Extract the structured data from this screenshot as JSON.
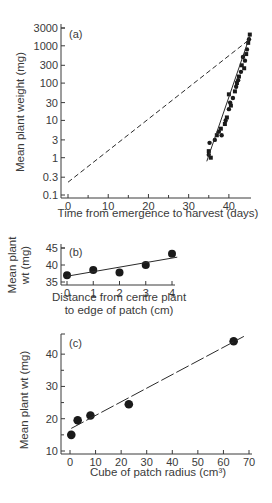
{
  "chart_data": [
    {
      "type": "scatter",
      "panel": "(a)",
      "title": "",
      "xlabel": "Time from emergence to harvest (days)",
      "ylabel": "Mean plant weight (mg)",
      "yscale": "log",
      "xlim": [
        0,
        45
      ],
      "ylim": [
        0.1,
        3000
      ],
      "xticks": [
        0,
        10,
        20,
        30,
        40
      ],
      "yticks": [
        0.1,
        0.3,
        1,
        3,
        10,
        30,
        100,
        300,
        1000,
        3000
      ],
      "ytick_labels": [
        "0.1",
        "0.3",
        "1",
        "3",
        "10",
        "30",
        "100",
        "300",
        "1000",
        "3000"
      ],
      "grid": false,
      "series": [
        {
          "name": "observed",
          "style": "markers",
          "x": [
            35,
            35,
            35.2,
            35.5,
            36.5,
            37,
            37.5,
            38,
            38.2,
            39,
            39.2,
            39.5,
            40,
            40,
            40.3,
            40.5,
            41,
            41.5,
            41.8,
            42,
            42.3,
            42.5,
            43,
            43.2,
            43.5,
            43.8,
            44,
            44.3,
            44.5,
            44.8,
            45,
            45.2
          ],
          "y": [
            1.2,
            1.5,
            2.5,
            1.0,
            3,
            4,
            5,
            6,
            4,
            8,
            10,
            12,
            20,
            50,
            30,
            25,
            40,
            60,
            80,
            100,
            120,
            150,
            200,
            300,
            500,
            250,
            400,
            600,
            800,
            1200,
            1500,
            2000
          ]
        },
        {
          "name": "fitted-steep",
          "style": "solid-line",
          "x": [
            34.5,
            45.2
          ],
          "y": [
            0.8,
            1800
          ]
        },
        {
          "name": "dashed-reference",
          "style": "dashed-line",
          "x": [
            0,
            45.2
          ],
          "y": [
            0.22,
            1500
          ]
        }
      ]
    },
    {
      "type": "scatter",
      "panel": "(b)",
      "xlabel": "Distance from centre plant to edge of patch (cm)",
      "ylabel": "Mean plant wt (mg)",
      "xlim": [
        0,
        4
      ],
      "ylim": [
        35,
        45
      ],
      "xticks": [
        0,
        1,
        2,
        3,
        4
      ],
      "yticks": [
        35,
        40,
        45
      ],
      "grid": false,
      "series": [
        {
          "name": "observed",
          "style": "markers",
          "x": [
            0,
            1,
            2,
            3,
            4
          ],
          "y": [
            37,
            38.5,
            37.8,
            40,
            43.3
          ]
        },
        {
          "name": "fit",
          "style": "solid-line",
          "x": [
            0,
            4.2
          ],
          "y": [
            36.7,
            42.3
          ]
        }
      ]
    },
    {
      "type": "scatter",
      "panel": "(c)",
      "xlabel": "Cube of patch radius (cm³)",
      "ylabel": "Mean plant wt (mg)",
      "xlim": [
        0,
        70
      ],
      "ylim": [
        10,
        45
      ],
      "xticks": [
        0,
        10,
        20,
        30,
        40,
        50,
        60,
        70
      ],
      "yticks": [
        10,
        20,
        30,
        40
      ],
      "grid": false,
      "series": [
        {
          "name": "observed",
          "style": "markers",
          "x": [
            0.5,
            3,
            8,
            23,
            64
          ],
          "y": [
            15,
            19.5,
            21,
            24.5,
            44
          ]
        },
        {
          "name": "fit",
          "style": "dash-line",
          "x": [
            0.5,
            68
          ],
          "y": [
            17,
            45.5
          ]
        }
      ]
    }
  ],
  "labels": {
    "a": {
      "panel": "(a)",
      "xlabel": "Time from emergence to harvest (days)",
      "ylabel": "Mean plant weight (mg)",
      "yticks": [
        "3000",
        "1000",
        "300",
        "100",
        "30",
        "10",
        "3",
        "1",
        "0.3",
        "0.1"
      ],
      "xticks": [
        "0",
        "10",
        "20",
        "30",
        "40"
      ]
    },
    "b": {
      "panel": "(b)",
      "xlabel_line1": "Distance from centre plant",
      "xlabel_line2": "to edge of patch (cm)",
      "ylabel_line1": "Mean plant",
      "ylabel_line2": "wt (mg)",
      "yticks": [
        "45",
        "40",
        "35"
      ],
      "xticks": [
        "0",
        "1",
        "2",
        "3",
        "4"
      ]
    },
    "c": {
      "panel": "(c)",
      "xlabel": "Cube of patch radius (cm³)",
      "ylabel": "Mean plant wt (mg)",
      "yticks": [
        "40",
        "30",
        "20",
        "10"
      ],
      "xticks": [
        "0",
        "10",
        "20",
        "30",
        "40",
        "50",
        "60",
        "70"
      ]
    }
  }
}
